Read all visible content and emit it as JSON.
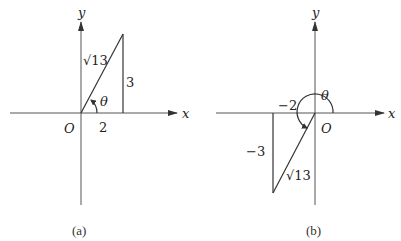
{
  "panels": [
    {
      "caption": "(a)",
      "axis_x_label": "x",
      "axis_y_label": "y",
      "origin_label": "O",
      "angle_label": "θ",
      "hypotenuse_label": "√13",
      "adjacent_label": "2",
      "opposite_label": "3"
    },
    {
      "caption": "(b)",
      "axis_x_label": "x",
      "axis_y_label": "y",
      "origin_label": "O",
      "angle_label": "θ",
      "hypotenuse_label": "√13",
      "adjacent_label": "−2",
      "opposite_label": "−3"
    }
  ]
}
